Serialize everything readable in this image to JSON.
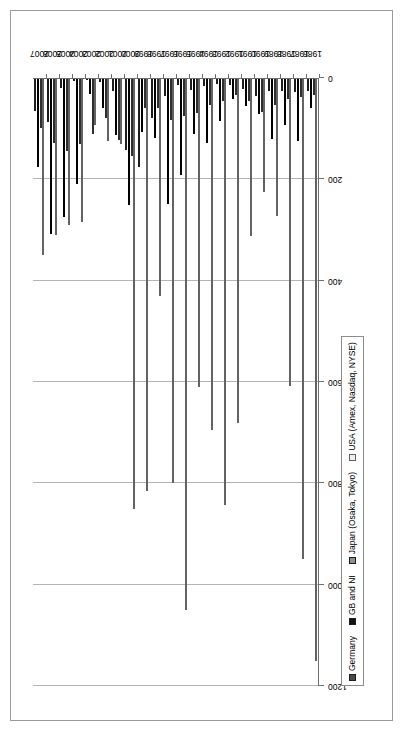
{
  "chart_data": {
    "type": "bar",
    "orientation": "horizontal",
    "title": "",
    "subtitle": "",
    "xlabel": "",
    "ylabel": "",
    "xlim": [
      0,
      1200
    ],
    "ticks": [
      "0",
      "200",
      "400",
      "600",
      "800",
      "1000",
      "1200"
    ],
    "tick_values": [
      0,
      200,
      400,
      600,
      800,
      1000,
      1200
    ],
    "grid": true,
    "legend_position": "bottom-left",
    "categories": [
      "1986",
      "1987",
      "1988",
      "1989",
      "1990",
      "1991",
      "1992",
      "1993",
      "1994",
      "1995",
      "1996",
      "1997",
      "1998",
      "1999",
      "2000",
      "2001",
      "2002",
      "2003",
      "2004",
      "2005",
      "2006",
      "2007"
    ],
    "series": [
      {
        "name": "Germany",
        "color": "#4a4a4a",
        "values": [
          25,
          27,
          25,
          25,
          35,
          21,
          14,
          11,
          15,
          23,
          14,
          35,
          79,
          175,
          142,
          26,
          7,
          0,
          5,
          19,
          87,
          65
        ]
      },
      {
        "name": "GB and NI",
        "color": "#111111",
        "values": [
          60,
          124,
          92,
          120,
          71,
          55,
          42,
          85,
          129,
          110,
          192,
          248,
          119,
          106,
          250,
          113,
          60,
          32,
          210,
          275,
          307,
          175
        ]
      },
      {
        "name": "Japan (Osaka, Tokyo)",
        "color": "#8f8f8f",
        "values": [
          34,
          37,
          42,
          54,
          68,
          45,
          34,
          46,
          54,
          69,
          75,
          83,
          60,
          60,
          154,
          123,
          79,
          110,
          130,
          145,
          129,
          98
        ]
      },
      {
        "name": "USA (Amex, Nasdaq, NYSE)",
        "color": "#eeeeee",
        "values": [
          1150,
          950,
          607,
          272,
          225,
          312,
          680,
          843,
          695,
          610,
          1050,
          800,
          430,
          815,
          850,
          130,
          125,
          92,
          285,
          290,
          310,
          350
        ]
      }
    ]
  },
  "legend": {
    "items": [
      {
        "label": "Germany",
        "swatch": "#4a4a4a"
      },
      {
        "label": "GB and NI",
        "swatch": "#111111"
      },
      {
        "label": "Japan (Osaka, Tokyo)",
        "swatch": "#8f8f8f"
      },
      {
        "label": "USA (Amex, Nasdaq, NYSE)",
        "swatch": "#eeeeee"
      }
    ]
  }
}
